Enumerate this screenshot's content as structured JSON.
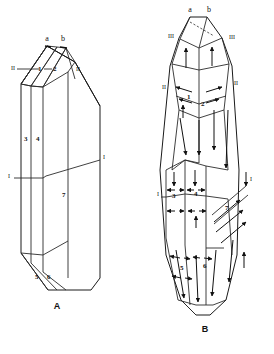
{
  "figure": {
    "background_color": "#ffffff",
    "stroke_color": "#1a1a1a",
    "panels": [
      {
        "id": "A",
        "label": "A",
        "caption_label": "A",
        "description": "Line drawing of a prismatic crystal block shown in perspective, subdivided into numbered zones.",
        "zone_labels": [
          "1",
          "2",
          "3",
          "4",
          "5",
          "6",
          "7"
        ],
        "boundary_labels": [
          "I",
          "II"
        ],
        "face_labels": [
          "a",
          "b"
        ]
      },
      {
        "id": "B",
        "label": "B",
        "caption_label": "B",
        "description": "Same crystal form drawn with internal flow arrows indicating growth directions in each numbered zone.",
        "zone_labels": [
          "1",
          "2",
          "3",
          "4",
          "5",
          "6",
          "7"
        ],
        "boundary_labels": [
          "I",
          "II",
          "III"
        ],
        "face_labels": [
          "a",
          "b"
        ]
      }
    ]
  },
  "panel_a": {
    "name": "A",
    "top_faces": {
      "a": "a",
      "b": "b"
    },
    "zones": {
      "z1": "1",
      "z2": "2",
      "z3": "3",
      "z4": "4",
      "z5": "5",
      "z6": "6",
      "z7": "7"
    },
    "boundaries": {
      "left_upper": "II",
      "right_upper": "II",
      "left_mid": "I",
      "right_mid": "I"
    }
  },
  "panel_b": {
    "name": "B",
    "top_faces": {
      "a": "a",
      "b": "b"
    },
    "zones": {
      "z1": "1",
      "z2": "2",
      "z3": "3",
      "z4": "4",
      "z5": "5",
      "z6": "6",
      "z7": "7"
    },
    "boundaries": {
      "left_top": "III",
      "right_top": "III",
      "left_upper": "II",
      "right_upper": "II",
      "left_mid": "I",
      "right_mid": "I"
    }
  }
}
